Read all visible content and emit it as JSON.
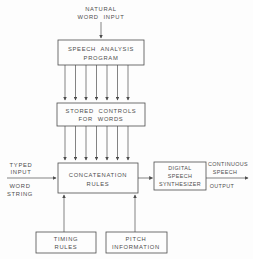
{
  "figure": {
    "type": "block-diagram",
    "colors": {
      "background": "#fdfdfd",
      "line": "#4d4d4d",
      "text": "#4d4d4d"
    },
    "labels": {
      "natural_input": {
        "l1": "NATURAL",
        "l2": "WORD INPUT"
      },
      "speech_analysis": {
        "l1": "SPEECH ANALYSIS",
        "l2": "PROGRAM"
      },
      "stored_controls": {
        "l1": "STORED CONTROLS",
        "l2": "FOR WORDS"
      },
      "concatenation": {
        "l1": "CONCATENATION",
        "l2": "RULES"
      },
      "typed_input": {
        "l1": "TYPED",
        "l2": "INPUT",
        "l3": "WORD",
        "l4": "STRING"
      },
      "digital_synthesizer": {
        "l1": "DIGITAL",
        "l2": "SPEECH",
        "l3": "SYNTHESIZER"
      },
      "continuous_output": {
        "l1": "CONTINUOUS",
        "l2": "SPEECH",
        "l3": "OUTPUT"
      },
      "timing_rules": {
        "l1": "TIMING",
        "l2": "RULES"
      },
      "pitch_information": {
        "l1": "PITCH",
        "l2": "INFORMATION"
      }
    },
    "arrows": {
      "analysis_to_stored_count": 7,
      "stored_to_concatenation_count": 7
    }
  }
}
